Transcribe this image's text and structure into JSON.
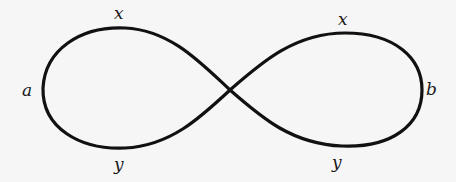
{
  "diagram": {
    "type": "figure-eight curve",
    "stroke_color": "#111111",
    "background": "#f6f6f6",
    "labels": {
      "left_top": "x",
      "left_side": "a",
      "left_bottom": "y",
      "right_top": "x",
      "right_side": "b",
      "right_bottom": "y"
    }
  }
}
